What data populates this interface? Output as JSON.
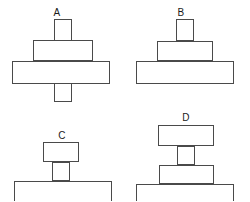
{
  "canvas": {
    "width": 250,
    "height": 201,
    "background": "#ffffff",
    "stroke_color": "#4a4a4a",
    "fill_color": "#ffffff",
    "label_color": "#1b1b1b"
  },
  "figures": [
    {
      "id": "A",
      "label": "A",
      "label_x": 57,
      "label_y": 8,
      "description": "vertical bar passing through a medium rectangle and a wide rectangle",
      "parts": [
        {
          "name": "vertical-post",
          "x": 54,
          "y": 19,
          "w": 18,
          "h": 83
        },
        {
          "name": "medium-rectangle",
          "x": 33,
          "y": 40,
          "w": 60,
          "h": 21
        },
        {
          "name": "wide-rectangle",
          "x": 12,
          "y": 61,
          "w": 98,
          "h": 23
        }
      ]
    },
    {
      "id": "B",
      "label": "B",
      "label_x": 181,
      "label_y": 8,
      "description": "three-tier pyramid stack of rectangles",
      "parts": [
        {
          "name": "top-rectangle",
          "x": 176,
          "y": 19,
          "w": 18,
          "h": 22
        },
        {
          "name": "middle-rectangle",
          "x": 157,
          "y": 41,
          "w": 56,
          "h": 20
        },
        {
          "name": "base-rectangle",
          "x": 136,
          "y": 61,
          "w": 98,
          "h": 23
        }
      ]
    },
    {
      "id": "C",
      "label": "C",
      "label_x": 62,
      "label_y": 131,
      "description": "small rectangle raised on a short post above a wide base",
      "parts": [
        {
          "name": "top-rectangle",
          "x": 43,
          "y": 142,
          "w": 36,
          "h": 20
        },
        {
          "name": "vertical-post",
          "x": 52,
          "y": 162,
          "w": 18,
          "h": 19
        },
        {
          "name": "base-rectangle",
          "x": 14,
          "y": 181,
          "w": 98,
          "h": 24
        }
      ]
    },
    {
      "id": "D",
      "label": "D",
      "label_x": 186,
      "label_y": 113,
      "description": "wide top rectangle on a post above a medium rectangle and a wide base",
      "parts": [
        {
          "name": "top-rectangle",
          "x": 158,
          "y": 125,
          "w": 56,
          "h": 21
        },
        {
          "name": "vertical-post",
          "x": 177,
          "y": 146,
          "w": 18,
          "h": 19
        },
        {
          "name": "medium-rectangle",
          "x": 159,
          "y": 165,
          "w": 55,
          "h": 19
        },
        {
          "name": "base-rectangle",
          "x": 136,
          "y": 184,
          "w": 98,
          "h": 21
        }
      ]
    }
  ]
}
